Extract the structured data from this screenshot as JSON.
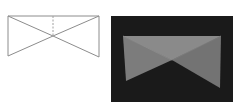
{
  "figure": {
    "colors": {
      "page_background": "#ffffff",
      "wireframe_line": "#8c8c8c",
      "wireframe_dashed": "#a0a0a0",
      "render_background": "#1a1a1a",
      "face_top": "#8a8a8a",
      "face_left": "#7c7c7c",
      "face_right": "#737373"
    },
    "wireframe": {
      "vertices": {
        "top_left": [
          8,
          16
        ],
        "top_right": [
          99,
          16
        ],
        "bottom_left": [
          8,
          56
        ],
        "bottom_right": [
          99,
          57
        ],
        "center": [
          53,
          36
        ],
        "top_mid": [
          53,
          16
        ]
      }
    },
    "render": {
      "panel": {
        "x": 111,
        "y": 16,
        "width": 122,
        "height": 86
      },
      "vertices": {
        "top_left": [
          123,
          36
        ],
        "top_right": [
          221,
          36
        ],
        "bottom_left": [
          126,
          81
        ],
        "bottom_right": [
          220,
          88
        ],
        "center": [
          172,
          60
        ]
      }
    }
  }
}
